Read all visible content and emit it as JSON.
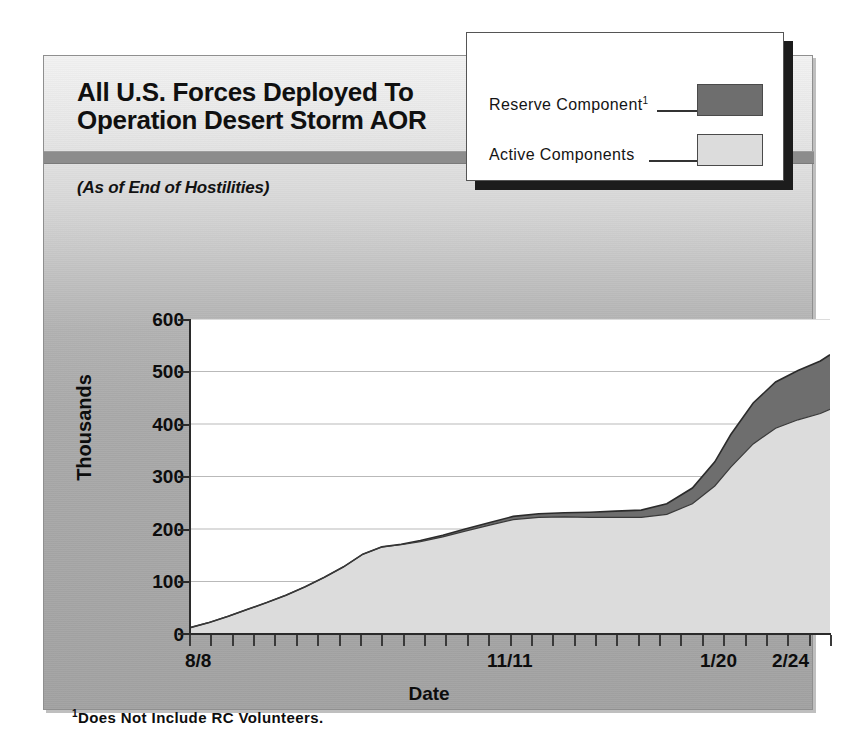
{
  "header": {
    "title_line1": "All U.S. Forces Deployed To",
    "title_line2": "Operation Desert Storm AOR",
    "subtitle": "(As of End of Hostilities)"
  },
  "legend": {
    "items": [
      {
        "label": "Reserve Component",
        "footnote_marker": "1",
        "swatch_color": "#6e6e6e",
        "swatch_style": "dark"
      },
      {
        "label": "Active  Components",
        "footnote_marker": "",
        "swatch_color": "#dcdcdc",
        "swatch_style": "light"
      }
    ]
  },
  "footnote": {
    "marker": "1",
    "text": "Does Not Include RC Volunteers."
  },
  "colors": {
    "reserve": "#6e6e6e",
    "active": "#dcdcdc",
    "plot_background": "#ffffff",
    "card_background": "#a9a9a9",
    "band": "#8c8c8c",
    "axis": "#2a2a2a",
    "gridline": "#b9b9b9"
  },
  "chart_data": {
    "type": "area",
    "stacked": true,
    "title": "All U.S. Forces Deployed To Operation Desert Storm AOR",
    "subtitle": "(As of End of Hostilities)",
    "xlabel": "Date",
    "ylabel": "Thousands",
    "ylim": [
      0,
      600
    ],
    "ytick_labels": [
      "600",
      "500",
      "400",
      "300",
      "200",
      "100",
      "0"
    ],
    "ytick_values": [
      600,
      500,
      400,
      300,
      200,
      100,
      0
    ],
    "grid": true,
    "legend_position": "top-right",
    "x_major_labels": [
      "8/8",
      "11/11",
      "1/20",
      "2/24"
    ],
    "x_major_positions": [
      0,
      0.505,
      0.845,
      1.0
    ],
    "x_minor_tick_count": 31,
    "x": [
      0.0,
      0.03,
      0.06,
      0.09,
      0.12,
      0.15,
      0.18,
      0.21,
      0.24,
      0.27,
      0.3,
      0.33,
      0.36,
      0.395,
      0.43,
      0.47,
      0.505,
      0.545,
      0.585,
      0.625,
      0.665,
      0.705,
      0.745,
      0.785,
      0.82,
      0.845,
      0.88,
      0.915,
      0.95,
      0.985,
      1.0
    ],
    "series": [
      {
        "name": "Active  Components",
        "color": "#dcdcdc",
        "values": [
          12,
          22,
          34,
          47,
          60,
          74,
          90,
          108,
          128,
          152,
          166,
          170,
          176,
          185,
          196,
          208,
          218,
          222,
          223,
          222,
          222,
          222,
          228,
          248,
          282,
          318,
          362,
          392,
          408,
          420,
          428
        ]
      },
      {
        "name": "Reserve Component",
        "color": "#6e6e6e",
        "values": [
          0,
          0,
          0,
          0,
          0,
          0,
          0,
          0,
          0,
          0,
          0,
          1,
          2,
          3,
          4,
          5,
          6,
          7,
          8,
          10,
          12,
          14,
          20,
          30,
          46,
          62,
          78,
          88,
          94,
          100,
          104
        ]
      }
    ],
    "totals": [
      12,
      22,
      34,
      47,
      60,
      74,
      90,
      108,
      128,
      152,
      166,
      171,
      178,
      188,
      200,
      213,
      224,
      229,
      231,
      232,
      234,
      236,
      248,
      278,
      328,
      380,
      440,
      480,
      502,
      520,
      532
    ]
  }
}
